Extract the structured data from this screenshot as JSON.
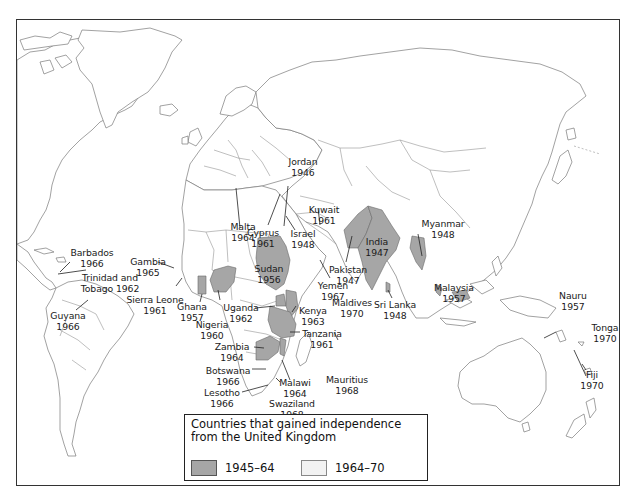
{
  "map": {
    "title": "Countries that gained independence from the United Kingdom",
    "colors": {
      "shaded": "#a6a6a6",
      "unshaded": "#ffffff",
      "border": "#7a7a7a",
      "frame": "#333333"
    },
    "legend": {
      "title_line1": "Countries that gained independence",
      "title_line2": "from the United Kingdom",
      "items": [
        {
          "label": "1945–64",
          "color": "#a6a6a6"
        },
        {
          "label": "1964–70",
          "color": "#f2f2f2"
        }
      ]
    },
    "labels": {
      "barbados": {
        "name": "Barbados",
        "year": "1966"
      },
      "trinidad": {
        "name": "Trinidad and",
        "year": "Tobago 1962"
      },
      "guyana": {
        "name": "Guyana",
        "year": "1966"
      },
      "gambia": {
        "name": "Gambia",
        "year": "1965"
      },
      "sierra_leone": {
        "name": "Sierra Leone",
        "year": "1961"
      },
      "ghana": {
        "name": "Ghana",
        "year": "1957"
      },
      "nigeria": {
        "name": "Nigeria",
        "year": "1960"
      },
      "malta": {
        "name": "Malta",
        "year": "1964"
      },
      "cyprus": {
        "name": "Cyprus",
        "year": "1961"
      },
      "jordan": {
        "name": "Jordan",
        "year": "1946"
      },
      "israel": {
        "name": "Israel",
        "year": "1948"
      },
      "kuwait": {
        "name": "Kuwait",
        "year": "1961"
      },
      "sudan": {
        "name": "Sudan",
        "year": "1956"
      },
      "pakistan": {
        "name": "Pakistan",
        "year": "1947"
      },
      "yemen": {
        "name": "Yemen",
        "year": "1967"
      },
      "maldives": {
        "name": "Maldives",
        "year": "1970"
      },
      "india": {
        "name": "India",
        "year": "1947"
      },
      "sri_lanka": {
        "name": "Sri Lanka",
        "year": "1948"
      },
      "myanmar": {
        "name": "Myanmar",
        "year": "1948"
      },
      "malaysia": {
        "name": "Malaysia",
        "year": "1957"
      },
      "uganda": {
        "name": "Uganda",
        "year": "1962"
      },
      "kenya": {
        "name": "Kenya",
        "year": "1963"
      },
      "tanzania": {
        "name": "Tanzania",
        "year": "1961"
      },
      "zambia": {
        "name": "Zambia",
        "year": "1964"
      },
      "botswana": {
        "name": "Botswana",
        "year": "1966"
      },
      "lesotho": {
        "name": "Lesotho",
        "year": "1966"
      },
      "malawi": {
        "name": "Malawi",
        "year": "1964"
      },
      "swaziland": {
        "name": "Swaziland",
        "year": "1968"
      },
      "mauritius": {
        "name": "Mauritius",
        "year": "1968"
      },
      "nauru": {
        "name": "Nauru",
        "year": "1957"
      },
      "tonga": {
        "name": "Tonga",
        "year": "1970"
      },
      "fiji": {
        "name": "Fiji",
        "year": "1970"
      }
    }
  }
}
